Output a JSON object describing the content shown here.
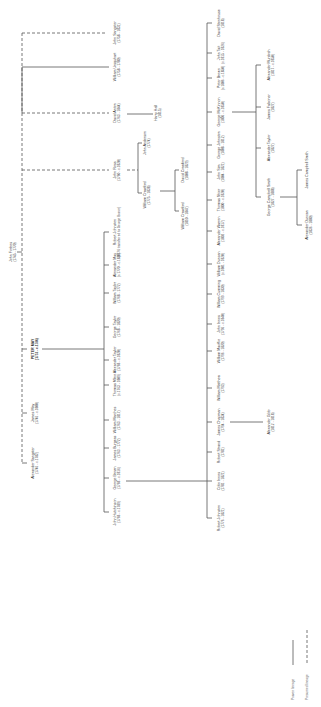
{
  "diagram": {
    "orientation": "rotated-90-ccw",
    "line_color": "#555555",
    "text_color": "#333333",
    "legend": [
      {
        "label": "Proven lineage",
        "style": "solid"
      },
      {
        "label": "Presumed lineage",
        "style": "dashed"
      }
    ],
    "nodes": [
      {
        "id": "john_forbes",
        "name": "John Forbes",
        "dates": "(1745 - 1770)",
        "x": 12,
        "y": 252
      },
      {
        "id": "john_sangster",
        "name": "John Sangster",
        "dates": "(1758 - 1831)",
        "x": 116,
        "y": 33
      },
      {
        "id": "william_ursquhart",
        "name": "William Ursquhart",
        "dates": "(1758 - 1780)",
        "x": 116,
        "y": 67
      },
      {
        "id": "david_anton",
        "name": "David Anton",
        "dates": "(1763 - 1844)",
        "x": 116,
        "y": 113
      },
      {
        "id": "harry_hall",
        "name": "Harry Hall",
        "dates": "(1815)",
        "x": 157,
        "y": 113
      },
      {
        "id": "john_ross",
        "name": "John Ross",
        "dates": "(1760 - c.1820)",
        "x": 116,
        "y": 170
      },
      {
        "id": "john_anderson",
        "name": "John Anderson",
        "dates": "(1774)",
        "x": 146,
        "y": 143
      },
      {
        "id": "william_crawford_sr",
        "name": "William Crawford",
        "dates": "(1775 - 1838)",
        "x": 146,
        "y": 195
      },
      {
        "id": "david_crawford",
        "name": "David Crawford",
        "dates": "(1808 - 1829)",
        "x": 184,
        "y": 170
      },
      {
        "id": "william_crawford_jr",
        "name": "William Crawford",
        "dates": "(1810 - 1847)",
        "x": 184,
        "y": 216
      },
      {
        "id": "peter_may",
        "name": "PETER MAY",
        "dates": "(1751 - c.1786)",
        "x": 34,
        "y": 349,
        "bold": true
      },
      {
        "id": "james_may",
        "name": "James May",
        "dates": "(1746 - c.1800)",
        "x": 34,
        "y": 413
      },
      {
        "id": "alexander_sangster",
        "name": "Alexander Sangster",
        "dates": "(1746 - c.1782)",
        "x": 34,
        "y": 463
      },
      {
        "id": "robert_johnston_1",
        "name": "Robert Johnston",
        "dates": "(1776 transferred to George Brown)",
        "x": 116,
        "y": 232
      },
      {
        "id": "alexander_may",
        "name": "Alexander May",
        "dates": "(c.1770 - c.1820)",
        "x": 116,
        "y": 265
      },
      {
        "id": "william_taylor",
        "name": "William Taylor",
        "dates": "(1768 - 1772)",
        "x": 116,
        "y": 293
      },
      {
        "id": "george_taylor",
        "name": "George Taylor",
        "dates": "(1768 - 1820)",
        "x": 116,
        "y": 327
      },
      {
        "id": "alexander_taylor_1",
        "name": "Alexander Taylor",
        "dates": "(1768 - c.1820)",
        "x": 116,
        "y": 360
      },
      {
        "id": "thomas_milne",
        "name": "Thomas Milne",
        "dates": "(c.1763 - 1809)",
        "x": 116,
        "y": 385
      },
      {
        "id": "william_marches",
        "name": "William Marches",
        "dates": "(1763 - 1817)",
        "x": 116,
        "y": 420
      },
      {
        "id": "james_burgess",
        "name": "James Burgess",
        "dates": "(1763 - 1772)",
        "x": 116,
        "y": 448
      },
      {
        "id": "george_brown",
        "name": "George Brown",
        "dates": "(1768 - c.1816)",
        "x": 116,
        "y": 478
      },
      {
        "id": "john_hutchinson",
        "name": "John Hutchinson",
        "dates": "(1768 - c.1789)",
        "x": 116,
        "y": 512
      },
      {
        "id": "david_stenhouse",
        "name": "David Stenhouse",
        "dates": "(1818)",
        "x": 220,
        "y": 23
      },
      {
        "id": "john_tait",
        "name": "John Tait",
        "dates": "(c.1815 - 1826)",
        "x": 220,
        "y": 53
      },
      {
        "id": "peter_brown",
        "name": "Peter Brown",
        "dates": "(c.1806 - c.1850)",
        "x": 220,
        "y": 78
      },
      {
        "id": "george_mchinnon",
        "name": "George McKinnon",
        "dates": "(1806 - c.1850)",
        "x": 220,
        "y": 112
      },
      {
        "id": "george_johnston",
        "name": "George Johnston",
        "dates": "(1808 - 1812)",
        "x": 220,
        "y": 145
      },
      {
        "id": "john_sim",
        "name": "John Sim",
        "dates": "(1804 - 1821)",
        "x": 220,
        "y": 172
      },
      {
        "id": "thomas_shier",
        "name": "Thomas Shier",
        "dates": "(1800 - c.1820)",
        "x": 220,
        "y": 200
      },
      {
        "id": "alexander_warren",
        "name": "Alexander Warren",
        "dates": "(1802 - c.1817)",
        "x": 220,
        "y": 231
      },
      {
        "id": "william_duncan",
        "name": "William Duncan",
        "dates": "(c.1801 - 1820)",
        "x": 220,
        "y": 264
      },
      {
        "id": "william_cumming",
        "name": "William Cumming",
        "dates": "(1799 - 1830)",
        "x": 220,
        "y": 294
      },
      {
        "id": "john_innes",
        "name": "John Innes",
        "dates": "(1796 - c.1840)",
        "x": 220,
        "y": 324
      },
      {
        "id": "william_machie",
        "name": "William MacKie",
        "dates": "(1796 - 1820)",
        "x": 220,
        "y": 351
      },
      {
        "id": "william_matthew",
        "name": "William Matthew",
        "dates": "(1793)",
        "x": 220,
        "y": 388
      },
      {
        "id": "james_chapman",
        "name": "James Chapman",
        "dates": "(1794 - 1834)",
        "x": 220,
        "y": 422
      },
      {
        "id": "alexander_gibb",
        "name": "Alexander Gibb",
        "dates": "(1812 - 1818)",
        "x": 270,
        "y": 422
      },
      {
        "id": "robert_strand",
        "name": "Robert Strand",
        "dates": "(1781)",
        "x": 220,
        "y": 452
      },
      {
        "id": "colin_innes",
        "name": "Colin Innes",
        "dates": "(1781 - 1821)",
        "x": 220,
        "y": 481
      },
      {
        "id": "robert_johnston_2",
        "name": "Robert Johnston",
        "dates": "(1776 - 1821)",
        "x": 220,
        "y": 518
      },
      {
        "id": "alexander_murdoch",
        "name": "Alexander Murdoch",
        "dates": "(1817 - c.1850)",
        "x": 270,
        "y": 65
      },
      {
        "id": "james_falconer",
        "name": "James Falconer",
        "dates": "(1827)",
        "x": 270,
        "y": 107
      },
      {
        "id": "alexander_taylor_2",
        "name": "Alexander Taylor",
        "dates": "(1827)",
        "x": 270,
        "y": 148
      },
      {
        "id": "george_campbell_smith",
        "name": "George Campbell Smith",
        "dates": "(1827 - 1888)",
        "x": 270,
        "y": 197
      },
      {
        "id": "james_campbell_smith",
        "name": "James Campbell Smith",
        "dates": "",
        "x": 308,
        "y": 170
      },
      {
        "id": "alexander_duncan",
        "name": "Alexander Duncan",
        "dates": "(1836 - 1880)",
        "x": 308,
        "y": 225
      }
    ],
    "edges": [
      {
        "from": "john_forbes",
        "to": "john_sangster",
        "style": "dashed"
      },
      {
        "from": "john_forbes",
        "to": "william_ursquhart",
        "style": "solid"
      },
      {
        "from": "john_forbes",
        "to": "david_anton",
        "style": "dashed"
      },
      {
        "from": "john_forbes",
        "to": "john_ross",
        "style": "dashed"
      },
      {
        "from": "john_forbes",
        "to": "peter_may",
        "style": "solid"
      },
      {
        "from": "john_forbes",
        "to": "james_may",
        "style": "dashed"
      },
      {
        "from": "john_forbes",
        "to": "alexander_sangster",
        "style": "dashed"
      },
      {
        "from": "david_anton",
        "to": "harry_hall",
        "style": "solid"
      },
      {
        "from": "john_ross",
        "to": "john_anderson",
        "style": "solid"
      },
      {
        "from": "john_ross",
        "to": "william_crawford_sr",
        "style": "solid"
      },
      {
        "from": "william_crawford_sr",
        "to": "david_crawford",
        "style": "solid"
      },
      {
        "from": "william_crawford_sr",
        "to": "william_crawford_jr",
        "style": "solid"
      },
      {
        "from": "peter_may",
        "to": "robert_johnston_1",
        "style": "solid"
      },
      {
        "from": "peter_may",
        "to": "john_hutchinson",
        "style": "solid"
      },
      {
        "from": "george_brown",
        "to": "david_stenhouse",
        "style": "solid"
      },
      {
        "from": "george_brown",
        "to": "robert_johnston_2",
        "style": "solid"
      },
      {
        "from": "james_chapman",
        "to": "alexander_gibb",
        "style": "solid"
      },
      {
        "from": "george_mchinnon",
        "to": "alexander_murdoch",
        "style": "solid"
      },
      {
        "from": "george_mchinnon",
        "to": "george_campbell_smith",
        "style": "solid"
      },
      {
        "from": "george_campbell_smith",
        "to": "james_campbell_smith",
        "style": "solid"
      },
      {
        "from": "george_campbell_smith",
        "to": "alexander_duncan",
        "style": "solid"
      }
    ]
  }
}
